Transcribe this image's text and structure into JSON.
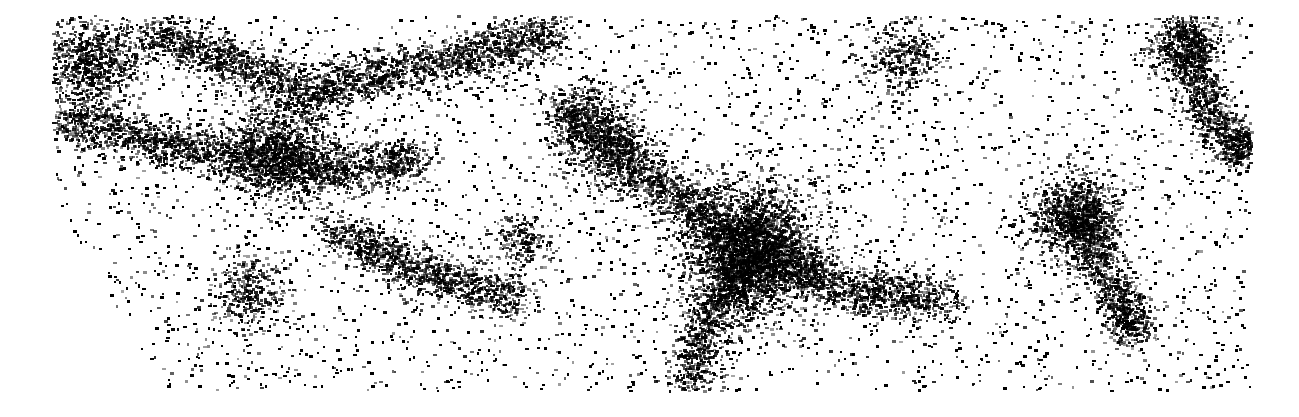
{
  "image": {
    "description": "Dense black-on-white point distribution resembling a galaxy/large-scale-structure map with filaments and clusters",
    "background": "#ffffff",
    "point_color": "#000000",
    "extent": {
      "left": 52,
      "top": 15,
      "right": 1250,
      "bottom": 390
    },
    "cut_corner": {
      "from": [
        52,
        195
      ],
      "to": [
        165,
        390
      ]
    },
    "clusters": [
      {
        "x": 750,
        "y": 250,
        "r": 55,
        "weight": 1.0
      },
      {
        "x": 1075,
        "y": 215,
        "r": 35,
        "weight": 0.9
      },
      {
        "x": 1185,
        "y": 45,
        "r": 30,
        "weight": 0.7
      },
      {
        "x": 90,
        "y": 60,
        "r": 40,
        "weight": 0.6
      },
      {
        "x": 280,
        "y": 150,
        "r": 45,
        "weight": 0.6
      },
      {
        "x": 600,
        "y": 140,
        "r": 40,
        "weight": 0.5
      },
      {
        "x": 1240,
        "y": 145,
        "r": 20,
        "weight": 0.6
      },
      {
        "x": 1130,
        "y": 320,
        "r": 20,
        "weight": 0.5
      },
      {
        "x": 250,
        "y": 290,
        "r": 30,
        "weight": 0.4
      },
      {
        "x": 520,
        "y": 240,
        "r": 25,
        "weight": 0.4
      },
      {
        "x": 900,
        "y": 60,
        "r": 30,
        "weight": 0.4
      }
    ],
    "filaments": [
      [
        [
          60,
          120
        ],
        [
          200,
          150
        ],
        [
          330,
          170
        ],
        [
          420,
          160
        ]
      ],
      [
        [
          150,
          30
        ],
        [
          300,
          90
        ],
        [
          450,
          60
        ],
        [
          560,
          30
        ]
      ],
      [
        [
          560,
          100
        ],
        [
          640,
          170
        ],
        [
          750,
          250
        ]
      ],
      [
        [
          750,
          250
        ],
        [
          850,
          290
        ],
        [
          950,
          300
        ]
      ],
      [
        [
          750,
          250
        ],
        [
          700,
          330
        ],
        [
          690,
          390
        ]
      ],
      [
        [
          1075,
          215
        ],
        [
          1120,
          300
        ],
        [
          1130,
          330
        ]
      ],
      [
        [
          1185,
          45
        ],
        [
          1210,
          120
        ],
        [
          1245,
          150
        ]
      ],
      [
        [
          330,
          230
        ],
        [
          420,
          270
        ],
        [
          520,
          300
        ]
      ]
    ]
  }
}
